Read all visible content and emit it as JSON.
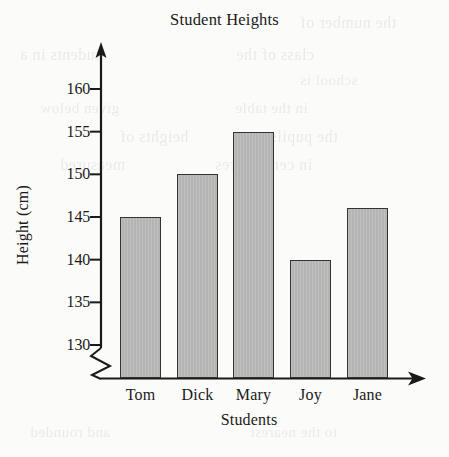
{
  "chart_data": {
    "type": "bar",
    "title": "Student Heights",
    "xlabel": "Students",
    "ylabel": "Height (cm)",
    "categories": [
      "Tom",
      "Dick",
      "Mary",
      "Joy",
      "Jane"
    ],
    "values": [
      145,
      150,
      155,
      140,
      146
    ],
    "ylim": [
      130,
      160
    ],
    "yticks": [
      130,
      135,
      140,
      145,
      150,
      155,
      160
    ],
    "ytick_labels": [
      "130",
      "135",
      "140",
      "145",
      "150",
      "155",
      "160"
    ],
    "grid": false,
    "legend": null,
    "axis_break": true,
    "axis_break_note": "zigzag break on vertical axis below 130",
    "bar_fill_color": "#b4b4b4",
    "bar_outline_color": "#333333",
    "axis_color": "#1a1a1a",
    "background_color": "#fbfbf9"
  },
  "ghost_text": [
    {
      "text": "the number of",
      "x": 300,
      "y": 14,
      "size": 16
    },
    {
      "text": "students in a",
      "x": 20,
      "y": 46,
      "size": 16
    },
    {
      "text": "class of the",
      "x": 236,
      "y": 46,
      "size": 16
    },
    {
      "text": "school is",
      "x": 300,
      "y": 72,
      "size": 15
    },
    {
      "text": "given below",
      "x": 40,
      "y": 100,
      "size": 15
    },
    {
      "text": "in the table",
      "x": 235,
      "y": 100,
      "size": 15
    },
    {
      "text": "heights of",
      "x": 120,
      "y": 128,
      "size": 16
    },
    {
      "text": "the pupils",
      "x": 270,
      "y": 128,
      "size": 16
    },
    {
      "text": "measured",
      "x": 60,
      "y": 156,
      "size": 16
    },
    {
      "text": "in centimetres",
      "x": 215,
      "y": 156,
      "size": 16
    },
    {
      "text": "and rounded",
      "x": 30,
      "y": 424,
      "size": 15
    },
    {
      "text": "to the nearest",
      "x": 250,
      "y": 424,
      "size": 15
    }
  ]
}
